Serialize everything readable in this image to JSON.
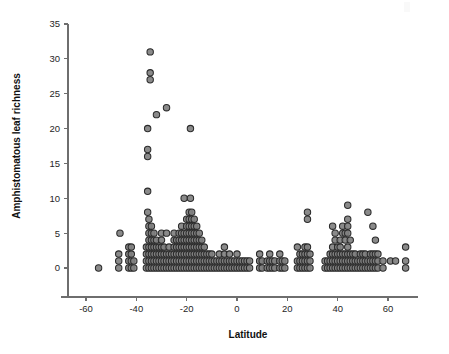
{
  "chart_data": {
    "type": "scatter",
    "title": "",
    "xlabel": "Latitude",
    "ylabel": "Amphistomatous leaf richness",
    "xlim": [
      -70,
      72
    ],
    "ylim": [
      -2,
      35
    ],
    "grid": false,
    "legend": null,
    "xticks": [
      -60,
      -40,
      -20,
      0,
      20,
      40,
      60
    ],
    "xtick_labels": [
      "-60",
      "-40",
      "-20",
      "0",
      "20",
      "40",
      "60"
    ],
    "yticks": [
      0,
      5,
      10,
      15,
      20,
      25,
      30,
      35
    ],
    "ytick_labels": [
      "0",
      "5",
      "10",
      "15",
      "20",
      "25",
      "30",
      "35"
    ],
    "marker": {
      "shape": "circle",
      "size_px": 6.4,
      "fill": "#808080",
      "edge": "#2b2b2b"
    },
    "points": [
      [
        -55,
        0
      ],
      [
        -47,
        2
      ],
      [
        -47,
        1
      ],
      [
        -47,
        0
      ],
      [
        -46.5,
        5
      ],
      [
        -43,
        3
      ],
      [
        -43,
        2
      ],
      [
        -43,
        1
      ],
      [
        -43,
        0
      ],
      [
        -42,
        3
      ],
      [
        -42,
        2
      ],
      [
        -42,
        1
      ],
      [
        -42,
        0
      ],
      [
        -41,
        1
      ],
      [
        -41,
        0
      ],
      [
        -36,
        3
      ],
      [
        -36,
        2
      ],
      [
        -36,
        1
      ],
      [
        -36,
        0
      ],
      [
        -35.5,
        8
      ],
      [
        -35.5,
        11
      ],
      [
        -35.5,
        17
      ],
      [
        -35.5,
        16
      ],
      [
        -35.5,
        20
      ],
      [
        -35,
        7
      ],
      [
        -35,
        6
      ],
      [
        -35,
        5
      ],
      [
        -35,
        4
      ],
      [
        -35,
        3
      ],
      [
        -35,
        2
      ],
      [
        -35,
        1
      ],
      [
        -35,
        0
      ],
      [
        -34.5,
        31
      ],
      [
        -34.5,
        28
      ],
      [
        -34.5,
        27
      ],
      [
        -34,
        6
      ],
      [
        -34,
        5
      ],
      [
        -34,
        4
      ],
      [
        -34,
        3
      ],
      [
        -34,
        2
      ],
      [
        -34,
        1
      ],
      [
        -34,
        0
      ],
      [
        -33,
        5
      ],
      [
        -33,
        4
      ],
      [
        -33,
        3
      ],
      [
        -33,
        2
      ],
      [
        -33,
        1
      ],
      [
        -33,
        0
      ],
      [
        -32,
        22
      ],
      [
        -32,
        4
      ],
      [
        -32,
        3
      ],
      [
        -32,
        2
      ],
      [
        -32,
        1
      ],
      [
        -32,
        0
      ],
      [
        -31,
        3
      ],
      [
        -31,
        2
      ],
      [
        -31,
        1
      ],
      [
        -31,
        0
      ],
      [
        -30,
        5
      ],
      [
        -30,
        4
      ],
      [
        -30,
        3
      ],
      [
        -30,
        2
      ],
      [
        -30,
        1
      ],
      [
        -30,
        0
      ],
      [
        -29,
        3
      ],
      [
        -29,
        2
      ],
      [
        -29,
        1
      ],
      [
        -29,
        0
      ],
      [
        -28,
        23
      ],
      [
        -28,
        5
      ],
      [
        -28,
        2
      ],
      [
        -28,
        1
      ],
      [
        -28,
        0
      ],
      [
        -27,
        3
      ],
      [
        -27,
        2
      ],
      [
        -27,
        1
      ],
      [
        -27,
        0
      ],
      [
        -26,
        2
      ],
      [
        -26,
        1
      ],
      [
        -26,
        0
      ],
      [
        -25,
        5
      ],
      [
        -25,
        4
      ],
      [
        -25,
        3
      ],
      [
        -25,
        2
      ],
      [
        -25,
        1
      ],
      [
        -25,
        0
      ],
      [
        -24,
        4
      ],
      [
        -24,
        3
      ],
      [
        -24,
        2
      ],
      [
        -24,
        1
      ],
      [
        -24,
        0
      ],
      [
        -23,
        5
      ],
      [
        -23,
        4
      ],
      [
        -23,
        3
      ],
      [
        -23,
        2
      ],
      [
        -23,
        1
      ],
      [
        -23,
        0
      ],
      [
        -22,
        6
      ],
      [
        -22,
        5
      ],
      [
        -22,
        4
      ],
      [
        -22,
        3
      ],
      [
        -22,
        2
      ],
      [
        -22,
        1
      ],
      [
        -22,
        0
      ],
      [
        -21,
        10
      ],
      [
        -21,
        5
      ],
      [
        -21,
        4
      ],
      [
        -21,
        3
      ],
      [
        -21,
        2
      ],
      [
        -21,
        1
      ],
      [
        -21,
        0
      ],
      [
        -20,
        7
      ],
      [
        -20,
        6
      ],
      [
        -20,
        5
      ],
      [
        -20,
        4
      ],
      [
        -20,
        3
      ],
      [
        -20,
        2
      ],
      [
        -20,
        1
      ],
      [
        -20,
        0
      ],
      [
        -19,
        8
      ],
      [
        -19,
        7
      ],
      [
        -19,
        6
      ],
      [
        -19,
        5
      ],
      [
        -19,
        4
      ],
      [
        -19,
        3
      ],
      [
        -19,
        2
      ],
      [
        -19,
        1
      ],
      [
        -19,
        0
      ],
      [
        -18.5,
        10
      ],
      [
        -18.5,
        20
      ],
      [
        -18,
        8
      ],
      [
        -18,
        7
      ],
      [
        -18,
        6
      ],
      [
        -18,
        5
      ],
      [
        -18,
        4
      ],
      [
        -18,
        3
      ],
      [
        -18,
        2
      ],
      [
        -18,
        1
      ],
      [
        -18,
        0
      ],
      [
        -17,
        7
      ],
      [
        -17,
        6
      ],
      [
        -17,
        5
      ],
      [
        -17,
        4
      ],
      [
        -17,
        3
      ],
      [
        -17,
        2
      ],
      [
        -17,
        1
      ],
      [
        -17,
        0
      ],
      [
        -16,
        6
      ],
      [
        -16,
        5
      ],
      [
        -16,
        4
      ],
      [
        -16,
        3
      ],
      [
        -16,
        2
      ],
      [
        -16,
        1
      ],
      [
        -16,
        0
      ],
      [
        -15,
        5
      ],
      [
        -15,
        4
      ],
      [
        -15,
        3
      ],
      [
        -15,
        2
      ],
      [
        -15,
        1
      ],
      [
        -15,
        0
      ],
      [
        -14,
        4
      ],
      [
        -14,
        3
      ],
      [
        -14,
        2
      ],
      [
        -14,
        1
      ],
      [
        -14,
        0
      ],
      [
        -13,
        3
      ],
      [
        -13,
        2
      ],
      [
        -13,
        1
      ],
      [
        -13,
        0
      ],
      [
        -12,
        2
      ],
      [
        -12,
        1
      ],
      [
        -12,
        0
      ],
      [
        -11,
        2
      ],
      [
        -11,
        1
      ],
      [
        -11,
        0
      ],
      [
        -10,
        2
      ],
      [
        -10,
        1
      ],
      [
        -10,
        0
      ],
      [
        -9,
        1
      ],
      [
        -9,
        0
      ],
      [
        -8,
        1
      ],
      [
        -8,
        0
      ],
      [
        -7,
        2
      ],
      [
        -7,
        1
      ],
      [
        -7,
        0
      ],
      [
        -6,
        1
      ],
      [
        -6,
        0
      ],
      [
        -5,
        3
      ],
      [
        -5,
        2
      ],
      [
        -5,
        1
      ],
      [
        -5,
        0
      ],
      [
        -4,
        1
      ],
      [
        -4,
        0
      ],
      [
        -3,
        2
      ],
      [
        -3,
        1
      ],
      [
        -3,
        0
      ],
      [
        -2,
        1
      ],
      [
        -2,
        0
      ],
      [
        -1,
        1
      ],
      [
        -1,
        0
      ],
      [
        0,
        2
      ],
      [
        0,
        1
      ],
      [
        0,
        0
      ],
      [
        1,
        1
      ],
      [
        1,
        0
      ],
      [
        2,
        1
      ],
      [
        2,
        0
      ],
      [
        3,
        1
      ],
      [
        3,
        0
      ],
      [
        4,
        1
      ],
      [
        4,
        0
      ],
      [
        5,
        1
      ],
      [
        5,
        0
      ],
      [
        9,
        2
      ],
      [
        9,
        1
      ],
      [
        9,
        0
      ],
      [
        10,
        1
      ],
      [
        10,
        0
      ],
      [
        12,
        1
      ],
      [
        12,
        0
      ],
      [
        13,
        2
      ],
      [
        13,
        1
      ],
      [
        13,
        0
      ],
      [
        14,
        1
      ],
      [
        14,
        0
      ],
      [
        15,
        1
      ],
      [
        15,
        0
      ],
      [
        17,
        2
      ],
      [
        17,
        1
      ],
      [
        17,
        0
      ],
      [
        18,
        1
      ],
      [
        18,
        0
      ],
      [
        19,
        1
      ],
      [
        19,
        0
      ],
      [
        24,
        3
      ],
      [
        24,
        1
      ],
      [
        24,
        0
      ],
      [
        25,
        2
      ],
      [
        25,
        1
      ],
      [
        25,
        0
      ],
      [
        26,
        2
      ],
      [
        26,
        1
      ],
      [
        26,
        0
      ],
      [
        27,
        3
      ],
      [
        27,
        2
      ],
      [
        27,
        1
      ],
      [
        27,
        0
      ],
      [
        28,
        8
      ],
      [
        28,
        7
      ],
      [
        28,
        3
      ],
      [
        28,
        2
      ],
      [
        28,
        1
      ],
      [
        28,
        0
      ],
      [
        29,
        2
      ],
      [
        29,
        1
      ],
      [
        29,
        0
      ],
      [
        35,
        1
      ],
      [
        35,
        0
      ],
      [
        36,
        1
      ],
      [
        36,
        0
      ],
      [
        37,
        2
      ],
      [
        37,
        1
      ],
      [
        37,
        0
      ],
      [
        38,
        6
      ],
      [
        38,
        3
      ],
      [
        38,
        2
      ],
      [
        38,
        1
      ],
      [
        38,
        0
      ],
      [
        39,
        5
      ],
      [
        39,
        4
      ],
      [
        39,
        2
      ],
      [
        39,
        1
      ],
      [
        39,
        0
      ],
      [
        40,
        3
      ],
      [
        40,
        2
      ],
      [
        40,
        1
      ],
      [
        40,
        0
      ],
      [
        41,
        4
      ],
      [
        41,
        3
      ],
      [
        41,
        2
      ],
      [
        41,
        1
      ],
      [
        41,
        0
      ],
      [
        42,
        6
      ],
      [
        42,
        5
      ],
      [
        42,
        2
      ],
      [
        42,
        1
      ],
      [
        42,
        0
      ],
      [
        43,
        5
      ],
      [
        43,
        4
      ],
      [
        43,
        2
      ],
      [
        43,
        1
      ],
      [
        43,
        0
      ],
      [
        44,
        9
      ],
      [
        44,
        7
      ],
      [
        44,
        6
      ],
      [
        44,
        5
      ],
      [
        44,
        3
      ],
      [
        44,
        2
      ],
      [
        44,
        1
      ],
      [
        44,
        0
      ],
      [
        45,
        4
      ],
      [
        45,
        2
      ],
      [
        45,
        1
      ],
      [
        45,
        0
      ],
      [
        46,
        2
      ],
      [
        46,
        1
      ],
      [
        46,
        0
      ],
      [
        47,
        2
      ],
      [
        47,
        1
      ],
      [
        47,
        0
      ],
      [
        48,
        1
      ],
      [
        48,
        0
      ],
      [
        49,
        2
      ],
      [
        49,
        1
      ],
      [
        49,
        0
      ],
      [
        50,
        2
      ],
      [
        50,
        1
      ],
      [
        50,
        0
      ],
      [
        51,
        2
      ],
      [
        51,
        1
      ],
      [
        51,
        0
      ],
      [
        52,
        8
      ],
      [
        52,
        1
      ],
      [
        52,
        0
      ],
      [
        53,
        2
      ],
      [
        53,
        1
      ],
      [
        53,
        0
      ],
      [
        54,
        6
      ],
      [
        54,
        2
      ],
      [
        54,
        1
      ],
      [
        54,
        0
      ],
      [
        55,
        4
      ],
      [
        55,
        2
      ],
      [
        55,
        1
      ],
      [
        55,
        0
      ],
      [
        56,
        2
      ],
      [
        56,
        1
      ],
      [
        56,
        0
      ],
      [
        58,
        1
      ],
      [
        58,
        0
      ],
      [
        61,
        1
      ],
      [
        63,
        1
      ],
      [
        67,
        3
      ],
      [
        67,
        1
      ],
      [
        67,
        0
      ]
    ]
  }
}
